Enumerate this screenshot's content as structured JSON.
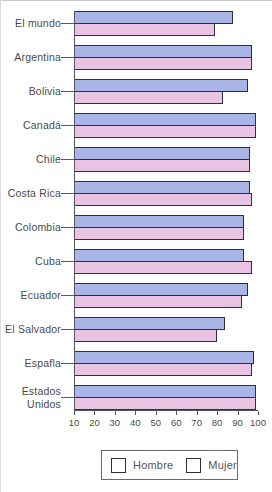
{
  "chart_data": {
    "type": "bar",
    "orientation": "horizontal",
    "title": "",
    "xlabel": "",
    "ylabel": "",
    "categories": [
      "El mundo",
      "Argentina",
      "Bolivia",
      "Canadá",
      "Chile",
      "Costa Rica",
      "Colombia",
      "Cuba",
      "Ecuador",
      "El Salvador",
      "Espafla",
      "Estados Unidos"
    ],
    "series": [
      {
        "name": "Hombre",
        "color": "#a9b5e6",
        "values": [
          88,
          97,
          95,
          99,
          96,
          96,
          93,
          93,
          95,
          84,
          98,
          99
        ]
      },
      {
        "name": "Mujer",
        "color": "#e8c4e2",
        "values": [
          79,
          97,
          83,
          99,
          96,
          97,
          93,
          97,
          92,
          80,
          97,
          99
        ]
      }
    ],
    "xlim": [
      10,
      100
    ],
    "x_ticks": [
      10,
      20,
      30,
      40,
      50,
      60,
      70,
      80,
      90,
      100
    ],
    "grid": false,
    "legend_position": "bottom"
  },
  "colors": {
    "bar_border": "#2e2e3e",
    "axis": "#55555f",
    "text": "#4a4a4a",
    "background": "#ffffff"
  }
}
